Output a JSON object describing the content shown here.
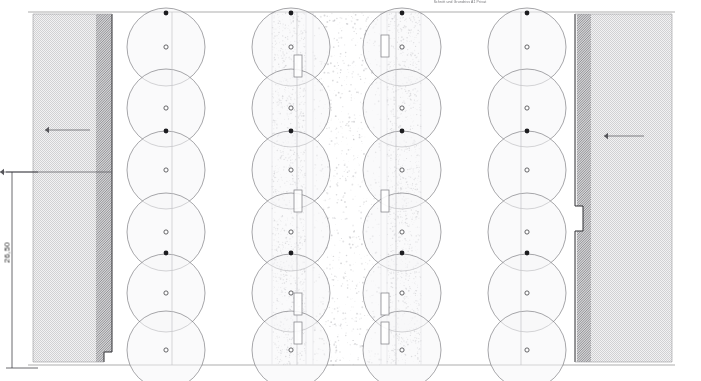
{
  "drawing": {
    "title": "Schnitt und Grundriss A1 Privat",
    "dimension_label": "26,50",
    "units": "m",
    "background_color": "#ffffff",
    "line_color": "#3a3a3a",
    "hatch_color": "#8d8d8d",
    "circle_color": "#6b6b70",
    "stipple_color": "#9a9aa0"
  },
  "geometry": {
    "canvas": {
      "width": 701,
      "height": 381
    },
    "slab": {
      "name": "floor-slab",
      "top_y": 12,
      "bottom_y": 365,
      "left_x": 28,
      "right_x": 675
    },
    "left_wall": {
      "name": "left-wall",
      "outer_x": 33,
      "inner_x": 112,
      "dark_band_x": 96,
      "top_y": 14,
      "bottom_y": 362,
      "step_x": 104,
      "step_y": 352
    },
    "right_wall": {
      "name": "right-wall",
      "outer_x": 672,
      "inner_x": 575,
      "dark_band_x": 591,
      "top_y": 14,
      "bottom_y": 362,
      "step_x": 583,
      "step_y_top": 206,
      "step_y_bottom": 231
    },
    "dimension_line": {
      "name": "vertical-dimension",
      "x": 12,
      "top_y": 172,
      "bottom_y": 368,
      "tick_length": 26
    },
    "leader_lines": [
      {
        "name": "leader-left-upper",
        "x1": 45,
        "y1": 130,
        "x2": 90,
        "y2": 130
      },
      {
        "name": "leader-left-lower",
        "x1": 0,
        "y1": 172,
        "x2": 112,
        "y2": 172
      },
      {
        "name": "leader-right",
        "x1": 604,
        "y1": 136,
        "x2": 644,
        "y2": 136
      }
    ],
    "circle_columns": [
      {
        "name": "column-1",
        "cx": 166,
        "radius": 39,
        "axis_x": 172
      },
      {
        "name": "column-2",
        "cx": 291,
        "radius": 39,
        "axis_x": 297
      },
      {
        "name": "column-3",
        "cx": 402,
        "radius": 39,
        "axis_x": 396
      },
      {
        "name": "column-4",
        "cx": 527,
        "radius": 39,
        "axis_x": 521
      }
    ],
    "circle_centers_y": [
      47,
      108,
      170,
      232,
      293,
      350
    ],
    "node_markers_y": [
      13,
      131,
      253,
      375
    ],
    "stipple_bands": [
      {
        "name": "stipple-band-left",
        "x": 272,
        "width": 34,
        "density": "dense"
      },
      {
        "name": "stipple-band-middle",
        "x": 313,
        "width": 68,
        "density": "sparse"
      },
      {
        "name": "stipple-band-right",
        "x": 387,
        "width": 34,
        "density": "dense"
      }
    ],
    "insert_rectangles": [
      {
        "name": "insert-left-a",
        "x": 294,
        "y": 55,
        "width": 8,
        "height": 22
      },
      {
        "name": "insert-left-b",
        "x": 294,
        "y": 190,
        "width": 8,
        "height": 22
      },
      {
        "name": "insert-left-c",
        "x": 294,
        "y": 293,
        "width": 8,
        "height": 22
      },
      {
        "name": "insert-left-d",
        "x": 294,
        "y": 322,
        "width": 8,
        "height": 22
      },
      {
        "name": "insert-right-a",
        "x": 381,
        "y": 35,
        "width": 8,
        "height": 22
      },
      {
        "name": "insert-right-b",
        "x": 381,
        "y": 190,
        "width": 8,
        "height": 22
      },
      {
        "name": "insert-right-c",
        "x": 381,
        "y": 293,
        "width": 8,
        "height": 22
      },
      {
        "name": "insert-right-d",
        "x": 381,
        "y": 322,
        "width": 8,
        "height": 22
      }
    ]
  }
}
